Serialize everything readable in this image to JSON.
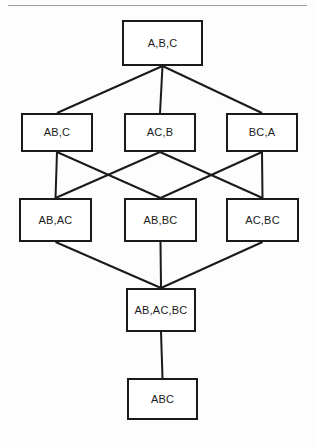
{
  "page": {
    "width": 315,
    "height": 448,
    "background_color": "#fdfdfd",
    "rule_color": "#9a9a9a",
    "line_color": "#1a1a1a",
    "box_border_color": "#1a1a1a",
    "box_fill_color": "#ffffff"
  },
  "diagram": {
    "type": "hasse-lattice",
    "title": "",
    "levels": 5,
    "nodes": [
      {
        "id": "n0",
        "label": "A,B,C",
        "level": 0,
        "x": 122,
        "y": 20,
        "w": 81,
        "h": 46
      },
      {
        "id": "n1",
        "label": "AB,C",
        "level": 1,
        "x": 21,
        "y": 113,
        "w": 72,
        "h": 39
      },
      {
        "id": "n2",
        "label": "AC,B",
        "level": 1,
        "x": 124,
        "y": 113,
        "w": 72,
        "h": 39
      },
      {
        "id": "n3",
        "label": "BC,A",
        "level": 1,
        "x": 226,
        "y": 113,
        "w": 72,
        "h": 39
      },
      {
        "id": "n4",
        "label": "AB,AC",
        "level": 2,
        "x": 19,
        "y": 198,
        "w": 73,
        "h": 44
      },
      {
        "id": "n5",
        "label": "AB,BC",
        "level": 2,
        "x": 124,
        "y": 198,
        "w": 73,
        "h": 44
      },
      {
        "id": "n6",
        "label": "AC,BC",
        "level": 2,
        "x": 226,
        "y": 198,
        "w": 73,
        "h": 44
      },
      {
        "id": "n7",
        "label": "AB,AC,BC",
        "level": 3,
        "x": 126,
        "y": 288,
        "w": 70,
        "h": 44
      },
      {
        "id": "n8",
        "label": "ABC",
        "level": 4,
        "x": 127,
        "y": 378,
        "w": 71,
        "h": 42
      }
    ],
    "edges": [
      {
        "from": "n0",
        "to": "n1"
      },
      {
        "from": "n0",
        "to": "n2"
      },
      {
        "from": "n0",
        "to": "n3"
      },
      {
        "from": "n1",
        "to": "n4"
      },
      {
        "from": "n1",
        "to": "n5"
      },
      {
        "from": "n2",
        "to": "n4"
      },
      {
        "from": "n2",
        "to": "n6"
      },
      {
        "from": "n3",
        "to": "n5"
      },
      {
        "from": "n3",
        "to": "n6"
      },
      {
        "from": "n4",
        "to": "n7"
      },
      {
        "from": "n5",
        "to": "n7"
      },
      {
        "from": "n6",
        "to": "n7"
      },
      {
        "from": "n7",
        "to": "n8"
      }
    ]
  }
}
